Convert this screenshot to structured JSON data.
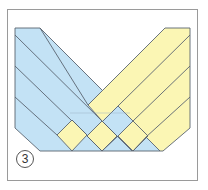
{
  "figure": {
    "step_number": "3"
  },
  "colors": {
    "blue_strip": "#c3e2f5",
    "yellow_strip": "#fbf6b4",
    "outline": "#5a6470",
    "frame": "#9a9a9a"
  },
  "strips": {
    "blue_count": 4,
    "yellow_count": 4
  }
}
